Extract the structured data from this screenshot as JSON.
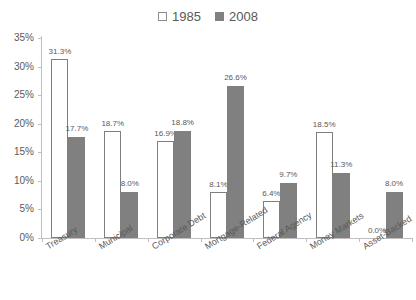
{
  "chart_data": {
    "type": "bar",
    "title": "",
    "subtitle": "",
    "xlabel": "",
    "ylabel": "",
    "ylim": [
      0,
      35
    ],
    "ytick_labels": [
      "0%",
      "5%",
      "10%",
      "15%",
      "20%",
      "25%",
      "30%",
      "35%"
    ],
    "ytick_values": [
      0,
      5,
      10,
      15,
      20,
      25,
      30,
      35
    ],
    "grid": false,
    "legend_position": "top-center",
    "categories": [
      "Treasury",
      "Municipal",
      "Corporate Debt",
      "Mortgage-Related",
      "Federal Agency",
      "Money Markets",
      "Asset-Backed"
    ],
    "series": [
      {
        "name": "1985",
        "color": "#ffffff",
        "border_color": "#7f7f7f",
        "values": [
          31.3,
          18.7,
          16.9,
          8.1,
          6.4,
          18.5,
          0.0
        ],
        "labels": [
          "31.3%",
          "18.7%",
          "16.9%",
          "8.1%",
          "6.4%",
          "18.5%",
          "0.0%"
        ]
      },
      {
        "name": "2008",
        "color": "#808080",
        "border_color": "#808080",
        "values": [
          17.7,
          8.0,
          18.8,
          26.6,
          9.7,
          11.3,
          8.0
        ],
        "labels": [
          "17.7%",
          "8.0%",
          "18.8%",
          "26.6%",
          "9.7%",
          "11.3%",
          "8.0%"
        ]
      }
    ]
  },
  "legend": {
    "entries": [
      {
        "label": "1985",
        "swatch": "unfilled-square-icon"
      },
      {
        "label": "2008",
        "swatch": "filled-square-icon"
      }
    ]
  },
  "colors": {
    "series_1985_fill": "#ffffff",
    "series_1985_stroke": "#7f7f7f",
    "series_2008_fill": "#808080",
    "axis": "#bfbfbf",
    "text": "#595959",
    "background": "#ffffff"
  }
}
